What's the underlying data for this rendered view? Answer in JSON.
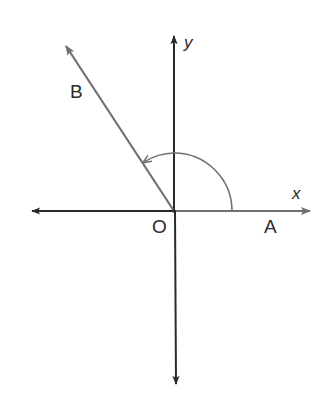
{
  "diagram": {
    "type": "angle-in-standard-position",
    "labels": {
      "x_axis": "x",
      "y_axis": "y",
      "origin": "O",
      "initial_point": "A",
      "terminal_point": "B"
    },
    "colors": {
      "axis": "#2a2a2a",
      "ray": "#707070",
      "arc": "#707070",
      "background": "#ffffff"
    },
    "rotation": "counterclockwise",
    "terminal_side_quadrant": "II"
  }
}
